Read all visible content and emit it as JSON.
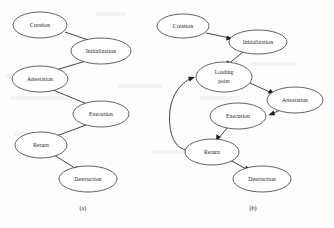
{
  "figure": {
    "background_color": "#fdfdfc",
    "stroke_color": "#2e2e2e",
    "text_color": "#1a1a1a",
    "width": 334,
    "height": 228
  },
  "diagrams": [
    {
      "id": "diagram-a",
      "caption": "(a)",
      "caption_x": 83,
      "caption_y": 209,
      "nodes": [
        {
          "id": "a-creation",
          "label": "Creation",
          "label2": "",
          "cx": 40,
          "cy": 25,
          "rx": 27,
          "ry": 13
        },
        {
          "id": "a-initialization",
          "label": "Initialization",
          "label2": "",
          "cx": 101,
          "cy": 51,
          "rx": 30,
          "ry": 13
        },
        {
          "id": "a-attestation",
          "label": "Attestation",
          "label2": "",
          "cx": 40,
          "cy": 79,
          "rx": 28,
          "ry": 13
        },
        {
          "id": "a-execution",
          "label": "Execution",
          "label2": "",
          "cx": 101,
          "cy": 114,
          "rx": 28,
          "ry": 13
        },
        {
          "id": "a-return",
          "label": "Return",
          "label2": "",
          "cx": 41,
          "cy": 145,
          "rx": 26,
          "ry": 13
        },
        {
          "id": "a-destruction",
          "label": "Destruction",
          "label2": "",
          "cx": 88,
          "cy": 179,
          "rx": 29,
          "ry": 13
        }
      ],
      "edges": [
        {
          "id": "a-edge-creation-initialization",
          "from": "Creation",
          "to": "Initialization"
        },
        {
          "id": "a-edge-initialization-attestation",
          "from": "Initialization",
          "to": "Attestation"
        },
        {
          "id": "a-edge-attestation-execution",
          "from": "Attestation",
          "to": "Execution"
        },
        {
          "id": "a-edge-execution-return",
          "from": "Execution",
          "to": "Return"
        },
        {
          "id": "a-edge-return-destruction",
          "from": "Return",
          "to": "Destruction"
        }
      ]
    },
    {
      "id": "diagram-b",
      "caption": "(b)",
      "caption_x": 253,
      "caption_y": 209,
      "nodes": [
        {
          "id": "b-creation",
          "label": "Creation",
          "label2": "",
          "cx": 183,
          "cy": 26,
          "rx": 26,
          "ry": 12
        },
        {
          "id": "b-initialization",
          "label": "Initialization",
          "label2": "",
          "cx": 258,
          "cy": 42,
          "rx": 29,
          "ry": 12
        },
        {
          "id": "b-loadingpoint",
          "label": "Loading",
          "label2": "point",
          "cx": 224,
          "cy": 77,
          "rx": 28,
          "ry": 15
        },
        {
          "id": "b-attestation",
          "label": "Attestation",
          "label2": "",
          "cx": 295,
          "cy": 100,
          "rx": 28,
          "ry": 13
        },
        {
          "id": "b-execution",
          "label": "Execution",
          "label2": "",
          "cx": 238,
          "cy": 116,
          "rx": 28,
          "ry": 13
        },
        {
          "id": "b-return",
          "label": "Return",
          "label2": "",
          "cx": 212,
          "cy": 152,
          "rx": 27,
          "ry": 13
        },
        {
          "id": "b-destruction",
          "label": "Destruction",
          "label2": "",
          "cx": 262,
          "cy": 179,
          "rx": 29,
          "ry": 13
        }
      ],
      "edges": [
        {
          "id": "b-edge-creation-initialization",
          "from": "Creation",
          "to": "Initialization"
        },
        {
          "id": "b-edge-initialization-loadingpoint",
          "from": "Initialization",
          "to": "Loading point"
        },
        {
          "id": "b-edge-loadingpoint-attestation",
          "from": "Loading point",
          "to": "Attestation"
        },
        {
          "id": "b-edge-attestation-execution",
          "from": "Attestation",
          "to": "Execution"
        },
        {
          "id": "b-edge-execution-return",
          "from": "Execution",
          "to": "Return"
        },
        {
          "id": "b-edge-return-destruction",
          "from": "Return",
          "to": "Destruction"
        },
        {
          "id": "b-edge-return-loadingpoint",
          "from": "Return",
          "to": "Loading point"
        }
      ]
    }
  ]
}
